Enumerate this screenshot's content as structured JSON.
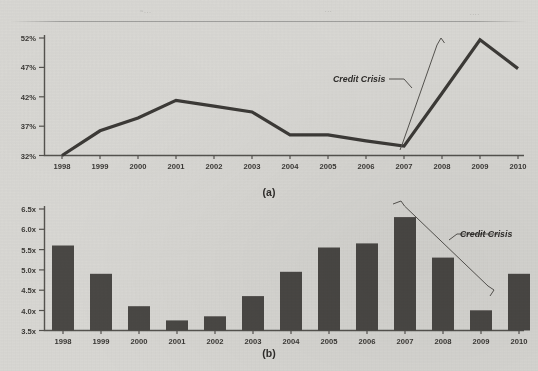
{
  "figure": {
    "background_color": "#d9d8d4",
    "ink_color": "#3c3a37",
    "bar_color": "#4a4845",
    "panel_a_label": "(a)",
    "panel_b_label": "(b)",
    "scan_marks": [
      "~...",
      "...",
      "...."
    ]
  },
  "chart_data": [
    {
      "type": "line",
      "panel": "(a)",
      "title": "",
      "xlabel": "",
      "ylabel": "",
      "categories": [
        "1998",
        "1999",
        "2000",
        "2001",
        "2002",
        "2003",
        "2004",
        "2005",
        "2006",
        "2007",
        "2008",
        "2009",
        "2010"
      ],
      "values": [
        32.0,
        36.2,
        38.4,
        41.4,
        40.4,
        39.4,
        35.5,
        35.5,
        34.5,
        33.6,
        42.6,
        51.7,
        46.8
      ],
      "tick_labels": [
        "32%",
        "37%",
        "42%",
        "47%",
        "52%"
      ],
      "tick_values": [
        32,
        37,
        42,
        47,
        52
      ],
      "ylim": [
        32,
        52
      ],
      "grid": false,
      "legend": "none",
      "annotations": [
        {
          "text": "Credit Crisis",
          "target_span": [
            "2007",
            "2009"
          ],
          "style": "bold-italic-with-brace"
        }
      ]
    },
    {
      "type": "bar",
      "panel": "(b)",
      "title": "",
      "xlabel": "",
      "ylabel": "",
      "categories": [
        "1998",
        "1999",
        "2000",
        "2001",
        "2002",
        "2003",
        "2004",
        "2005",
        "2006",
        "2007",
        "2008",
        "2009",
        "2010"
      ],
      "values": [
        5.6,
        4.9,
        4.1,
        3.75,
        3.85,
        4.35,
        4.95,
        5.55,
        5.65,
        6.3,
        5.3,
        4.0,
        4.9
      ],
      "tick_labels": [
        "3.5x",
        "4.0x",
        "4.5x",
        "5.0x",
        "5.5x",
        "6.0x",
        "6.5x"
      ],
      "tick_values": [
        3.5,
        4.0,
        4.5,
        5.0,
        5.5,
        6.0,
        6.5
      ],
      "ylim": [
        3.5,
        6.5
      ],
      "grid": false,
      "legend": "none",
      "annotations": [
        {
          "text": "Credit Crisis",
          "target_span": [
            "2007",
            "2009"
          ],
          "style": "bold-italic-with-brace"
        }
      ]
    }
  ],
  "panel_a": {
    "label": "(a)",
    "y_ticks": [
      "32%",
      "37%",
      "42%",
      "47%",
      "52%"
    ],
    "x_ticks": [
      "1998",
      "1999",
      "2000",
      "2001",
      "2002",
      "2003",
      "2004",
      "2005",
      "2006",
      "2007",
      "2008",
      "2009",
      "2010"
    ],
    "annotation": "Credit Crisis"
  },
  "panel_b": {
    "label": "(b)",
    "y_ticks": [
      "3.5x",
      "4.0x",
      "4.5x",
      "5.0x",
      "5.5x",
      "6.0x",
      "6.5x"
    ],
    "x_ticks": [
      "1998",
      "1999",
      "2000",
      "2001",
      "2002",
      "2003",
      "2004",
      "2005",
      "2006",
      "2007",
      "2008",
      "2009",
      "2010"
    ],
    "annotation": "Credit Crisis"
  }
}
